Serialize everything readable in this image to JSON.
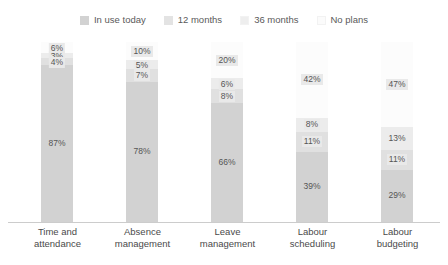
{
  "chart_data": {
    "type": "bar",
    "subtype": "stacked-bar-100",
    "title": "",
    "xlabel": "",
    "ylabel": "",
    "ylim": [
      0,
      100
    ],
    "grid": false,
    "legend_position": "top-center",
    "stack_order_bottom_to_top": [
      "In use today",
      "12 months",
      "36 months",
      "No plans"
    ],
    "categories": [
      "Time and attendance",
      "Absence management",
      "Leave management",
      "Labour scheduling",
      "Labour budgeting"
    ],
    "series": [
      {
        "name": "In use today",
        "color": "#d2d2d2",
        "values": [
          87,
          78,
          66,
          39,
          29
        ]
      },
      {
        "name": "12 months",
        "color": "#e0e0e0",
        "values": [
          4,
          7,
          8,
          11,
          11
        ]
      },
      {
        "name": "36 months",
        "color": "#ececec",
        "values": [
          3,
          5,
          6,
          8,
          13
        ]
      },
      {
        "name": "No plans",
        "color": "#fafafa",
        "values": [
          6,
          10,
          20,
          42,
          47
        ]
      }
    ],
    "value_labels": {
      "Time and attendance": {
        "No plans": "6%",
        "36 months": "3%",
        "12 months": "4%",
        "In use today": "87%"
      },
      "Absence management": {
        "No plans": "10%",
        "36 months": "5%",
        "12 months": "7%",
        "In use today": "78%"
      },
      "Leave management": {
        "No plans": "20%",
        "36 months": "6%",
        "12 months": "8%",
        "In use today": "66%"
      },
      "Labour scheduling": {
        "No plans": "42%",
        "36 months": "8%",
        "12 months": "11%",
        "In use today": "39%"
      },
      "Labour budgeting": {
        "No plans": "47%",
        "36 months": "13%",
        "12 months": "11%",
        "In use today": "29%"
      }
    }
  },
  "legend": {
    "items": [
      {
        "label": "In use today",
        "color": "#d2d2d2"
      },
      {
        "label": "12 months",
        "color": "#e3e3e3"
      },
      {
        "label": "36 months",
        "color": "#eeeeee"
      },
      {
        "label": "No plans",
        "color": "#fbfbfb"
      }
    ]
  },
  "axis": {
    "line_color": "#cccccc"
  },
  "categories": [
    {
      "line1": "Time and",
      "line2": "attendance"
    },
    {
      "line1": "Absence",
      "line2": "management"
    },
    {
      "line1": "Leave",
      "line2": "management"
    },
    {
      "line1": "Labour",
      "line2": "scheduling"
    },
    {
      "line1": "Labour",
      "line2": "budgeting"
    }
  ]
}
